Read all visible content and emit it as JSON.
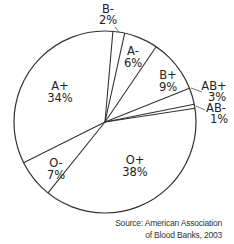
{
  "chart_data": {
    "type": "pie",
    "title": "",
    "categories": [
      "A+",
      "B-",
      "A-",
      "B+",
      "AB+",
      "AB-",
      "O+",
      "O-"
    ],
    "values": [
      34,
      2,
      6,
      9,
      3,
      1,
      38,
      7
    ],
    "labels": [
      "34%",
      "2%",
      "6%",
      "9%",
      "3%",
      "1%",
      "38%",
      "7%"
    ],
    "source": [
      "Source: American Association",
      "of Blood Banks, 2003"
    ],
    "center": [
      105,
      122
    ],
    "radius": 91,
    "boundary_angles_deg": [
      -85,
      -77.5,
      -55.8,
      -21.8,
      -11.3,
      -8.7,
      128.8,
      153.4
    ],
    "colors": {
      "stroke": "#333333",
      "fill": "#ffffff",
      "text": "#222222"
    }
  },
  "slices": [
    {
      "name": "B-",
      "pct": "2%",
      "tx": 108,
      "ty": 13,
      "px": 108,
      "py": 24
    },
    {
      "name": "A-",
      "pct": "6%",
      "tx": 133,
      "ty": 55,
      "px": 133,
      "py": 67
    },
    {
      "name": "B+",
      "pct": "9%",
      "tx": 168,
      "ty": 79,
      "px": 168,
      "py": 91
    },
    {
      "name": "AB+",
      "pct": "3%",
      "tx": 214,
      "ty": 90,
      "px": 217,
      "py": 101
    },
    {
      "name": "AB-",
      "pct": "1%",
      "tx": 216,
      "ty": 112,
      "px": 219,
      "py": 123
    },
    {
      "name": "A+",
      "pct": "34%",
      "tx": 60,
      "ty": 90,
      "px": 60,
      "py": 102
    },
    {
      "name": "O-",
      "pct": "7%",
      "tx": 56,
      "ty": 167,
      "px": 56,
      "py": 179
    },
    {
      "name": "O+",
      "pct": "38%",
      "tx": 135,
      "ty": 164,
      "px": 135,
      "py": 176
    }
  ],
  "leaders": [
    {
      "name": "B-",
      "x1": 115,
      "y1": 27,
      "x2": 119,
      "y2": 32
    },
    {
      "name": "AB+",
      "x1": 191,
      "y1": 88,
      "x2": 202,
      "y2": 92
    },
    {
      "name": "AB-",
      "x1": 196,
      "y1": 106,
      "x2": 205,
      "y2": 110
    }
  ]
}
